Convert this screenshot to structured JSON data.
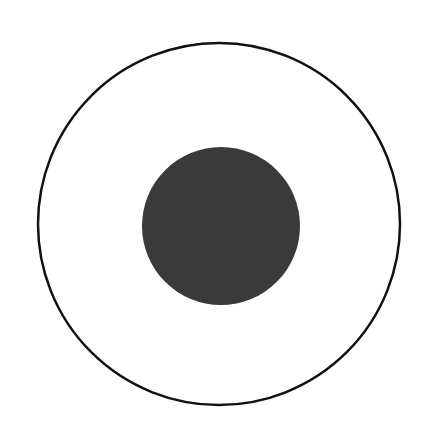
{
  "diagram": {
    "shapes": [
      {
        "type": "circle",
        "role": "outer-ring",
        "cx": 219,
        "cy": 224,
        "r": 181,
        "fill": "none",
        "stroke": "#111111",
        "stroke_width": 2.5
      },
      {
        "type": "circle",
        "role": "inner-disc",
        "cx": 221,
        "cy": 226,
        "r": 79,
        "fill": "#3a3a3a",
        "stroke": "none"
      }
    ],
    "background": "#ffffff"
  }
}
